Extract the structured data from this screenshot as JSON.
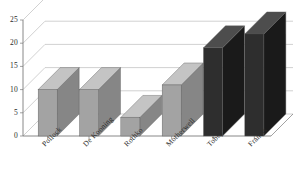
{
  "chart_data": {
    "type": "bar",
    "title": "",
    "xlabel": "",
    "ylabel": "",
    "categories": [
      "Pollock",
      "De Kooning",
      "Rothko",
      "Motherwell",
      "Tobey",
      "Francis"
    ],
    "values": [
      10,
      10,
      4,
      11,
      19,
      22
    ],
    "ylim": [
      0,
      25
    ],
    "ytick_labels": [
      "0",
      "5",
      "10",
      "15",
      "20",
      "25"
    ],
    "ytick_values": [
      0,
      5,
      10,
      15,
      20,
      25
    ],
    "grid": true,
    "legend": "none",
    "style": "3d-perspective-column",
    "bar_colors": [
      "#a3a3a3",
      "#a3a3a3",
      "#a3a3a3",
      "#a3a3a3",
      "#2e2e2e",
      "#2e2e2e"
    ],
    "colors": {
      "bar_light": "#a3a3a3",
      "bar_light_top": "#c4c4c4",
      "bar_light_side": "#868686",
      "bar_dark": "#2e2e2e",
      "bar_dark_top": "#4d4d4d",
      "bar_dark_side": "#1a1a1a",
      "grid": "#bdbdbd",
      "axis": "#7a7a7a",
      "text": "#2b2b2b",
      "background": "#ffffff"
    }
  }
}
